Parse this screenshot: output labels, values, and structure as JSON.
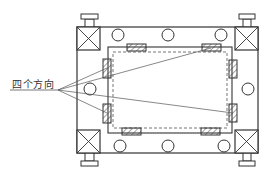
{
  "diagram": {
    "title": "",
    "label": {
      "text": "四个方向",
      "x": 12,
      "y": 76
    },
    "colors": {
      "line": "#333333",
      "leader": "#555555",
      "background": "#ffffff"
    },
    "outer_frame": {
      "x": 77,
      "y": 27,
      "w": 181,
      "h": 126
    },
    "inner_frame": {
      "x": 108,
      "y": 47,
      "w": 124,
      "h": 86
    },
    "dashed_frame": {
      "x": 113,
      "y": 52,
      "w": 114,
      "h": 76
    },
    "corner_cross_boxes": [
      {
        "name": "top-left",
        "x": 77,
        "y": 27,
        "w": 23,
        "h": 23
      },
      {
        "name": "top-right",
        "x": 235,
        "y": 27,
        "w": 23,
        "h": 23
      },
      {
        "name": "bottom-left",
        "x": 77,
        "y": 130,
        "w": 23,
        "h": 23
      },
      {
        "name": "bottom-right",
        "x": 235,
        "y": 130,
        "w": 23,
        "h": 23
      }
    ],
    "leveling_feet": [
      {
        "name": "top-left",
        "post": {
          "x": 85,
          "y": 19,
          "w": 9,
          "h": 8
        },
        "cap": {
          "x": 81,
          "y": 14,
          "w": 17,
          "h": 5
        }
      },
      {
        "name": "top-right",
        "post": {
          "x": 243,
          "y": 19,
          "w": 8,
          "h": 8
        },
        "cap": {
          "x": 239,
          "y": 14,
          "w": 16,
          "h": 5
        }
      },
      {
        "name": "bottom-left",
        "post": {
          "x": 85,
          "y": 153,
          "w": 9,
          "h": 8
        },
        "cap": {
          "x": 81,
          "y": 161,
          "w": 17,
          "h": 5
        }
      },
      {
        "name": "bottom-right",
        "post": {
          "x": 243,
          "y": 153,
          "w": 8,
          "h": 8
        },
        "cap": {
          "x": 239,
          "y": 161,
          "w": 16,
          "h": 5
        }
      }
    ],
    "circles": [
      {
        "cx": 118,
        "cy": 35,
        "r": 6
      },
      {
        "cx": 168,
        "cy": 35,
        "r": 6
      },
      {
        "cx": 221,
        "cy": 35,
        "r": 6
      },
      {
        "cx": 120,
        "cy": 146,
        "r": 6
      },
      {
        "cx": 168,
        "cy": 146,
        "r": 6
      },
      {
        "cx": 224,
        "cy": 146,
        "r": 6
      },
      {
        "cx": 90,
        "cy": 89,
        "r": 6
      },
      {
        "cx": 248,
        "cy": 89,
        "r": 6
      }
    ],
    "hatched_pads": [
      {
        "name": "top-left",
        "x": 127,
        "y": 44,
        "w": 19,
        "h": 7
      },
      {
        "name": "top-right",
        "x": 202,
        "y": 44,
        "w": 19,
        "h": 7
      },
      {
        "name": "bottom-left",
        "x": 122,
        "y": 128,
        "w": 19,
        "h": 7
      },
      {
        "name": "bottom-right",
        "x": 201,
        "y": 128,
        "w": 19,
        "h": 7
      },
      {
        "name": "left-upper",
        "x": 103,
        "y": 59,
        "w": 8,
        "h": 19
      },
      {
        "name": "left-lower",
        "x": 103,
        "y": 104,
        "w": 8,
        "h": 19
      },
      {
        "name": "right-upper",
        "x": 229,
        "y": 60,
        "w": 8,
        "h": 18
      },
      {
        "name": "right-lower",
        "x": 229,
        "y": 104,
        "w": 8,
        "h": 18
      }
    ],
    "leader": {
      "underline": {
        "x1": 10,
        "y1": 90,
        "x2": 58,
        "y2": 90
      },
      "origin": {
        "x": 58,
        "y": 90
      },
      "targets": [
        {
          "x": 211,
          "y": 48
        },
        {
          "x": 107,
          "y": 68
        },
        {
          "x": 233,
          "y": 113
        },
        {
          "x": 107,
          "y": 113
        }
      ]
    }
  }
}
